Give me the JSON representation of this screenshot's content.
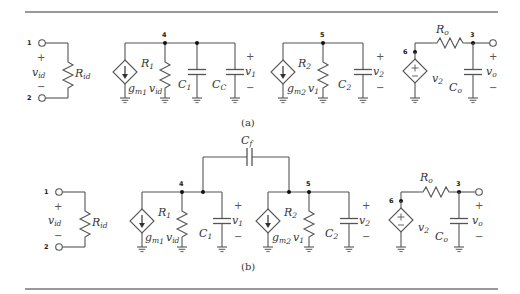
{
  "figure": {
    "subfigure_a": {
      "caption": "(a)",
      "input_stage": {
        "terminal_top": "1",
        "terminal_bottom": "2",
        "voltage_label": "v",
        "voltage_sub": "id",
        "resistor_label": "R",
        "resistor_sub": "id"
      },
      "stage1": {
        "node": "4",
        "source_label_g": "g",
        "source_label_gsub": "m",
        "source_label_gsub2": "1",
        "source_label_v": "v",
        "source_label_vsub": "id",
        "resistor_label": "R",
        "resistor_sub": "1",
        "cap1_label": "C",
        "cap1_sub": "1",
        "cap2_label": "C",
        "cap2_sub": "C",
        "voltage_label": "v",
        "voltage_sub": "1"
      },
      "stage2": {
        "node": "5",
        "source_label_g": "g",
        "source_label_gsub": "m",
        "source_label_gsub2": "2",
        "source_label_v": "v",
        "source_label_vsub": "1",
        "resistor_label": "R",
        "resistor_sub": "2",
        "cap_label": "C",
        "cap_sub": "2",
        "voltage_label": "v",
        "voltage_sub": "2"
      },
      "output_stage": {
        "node_source": "6",
        "node_out": "3",
        "resistor_label": "R",
        "resistor_sub": "o",
        "source_label": "v",
        "source_sub": "2",
        "cap_label": "C",
        "cap_sub": "o",
        "voltage_label": "v",
        "voltage_sub": "o"
      }
    },
    "subfigure_b": {
      "caption": "(b)",
      "feedback_cap_label": "C",
      "feedback_cap_sub": "f",
      "input_stage": {
        "terminal_top": "1",
        "terminal_bottom": "2",
        "voltage_label": "v",
        "voltage_sub": "id",
        "resistor_label": "R",
        "resistor_sub": "id"
      },
      "stage1": {
        "node": "4",
        "source_label_g": "g",
        "source_label_gsub": "m",
        "source_label_gsub2": "1",
        "source_label_v": "v",
        "source_label_vsub": "id",
        "resistor_label": "R",
        "resistor_sub": "1",
        "cap_label": "C",
        "cap_sub": "1",
        "voltage_label": "v",
        "voltage_sub": "1"
      },
      "stage2": {
        "node": "5",
        "source_label_g": "g",
        "source_label_gsub": "m",
        "source_label_gsub2": "2",
        "source_label_v": "v",
        "source_label_vsub": "1",
        "resistor_label": "R",
        "resistor_sub": "2",
        "cap_label": "C",
        "cap_sub": "2",
        "voltage_label": "v",
        "voltage_sub": "2"
      },
      "output_stage": {
        "node_source": "6",
        "node_out": "3",
        "resistor_label": "R",
        "resistor_sub": "o",
        "source_label": "v",
        "source_sub": "2",
        "cap_label": "C",
        "cap_sub": "o",
        "voltage_label": "v",
        "voltage_sub": "o"
      }
    },
    "signs": {
      "plus": "+",
      "minus": "−"
    }
  }
}
